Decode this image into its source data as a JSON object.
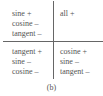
{
  "quadrants": {
    "top_left": {
      "lines": [
        "sine +",
        "cosine –",
        "tangent –"
      ]
    },
    "top_right": {
      "lines": [
        "all +"
      ]
    },
    "bottom_left": {
      "lines": [
        "tangent +",
        "sine –",
        "cosine –"
      ]
    },
    "bottom_right": {
      "lines": [
        "cosine +",
        "sine –",
        "tangent –"
      ]
    }
  },
  "caption": "(b)"
}
